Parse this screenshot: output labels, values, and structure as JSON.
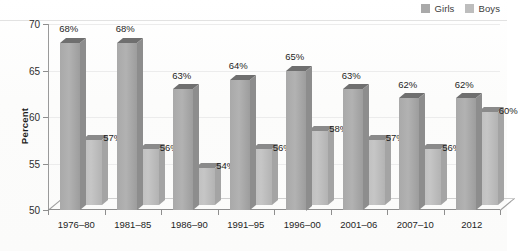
{
  "chart_data": {
    "type": "bar",
    "title": "",
    "subtitle": "",
    "xlabel": "",
    "ylabel": "Percent",
    "ylim": [
      50,
      70
    ],
    "yticks": [
      50,
      55,
      60,
      65,
      70
    ],
    "ytick_labels": [
      "50",
      "55",
      "60",
      "65",
      "70"
    ],
    "grid": true,
    "legend_position": "top-right",
    "style": "3d-grouped-bar-grayscale",
    "categories": [
      "1976–80",
      "1981–85",
      "1986–90",
      "1991–95",
      "1996–00",
      "2001–06",
      "2007–10",
      "2012"
    ],
    "series": [
      {
        "name": "Girls",
        "color": "#a9a9a9",
        "values": [
          68,
          68,
          63,
          64,
          65,
          63,
          62,
          62
        ],
        "labels": [
          "68%",
          "68%",
          "63%",
          "64%",
          "65%",
          "63%",
          "62%",
          "62%"
        ]
      },
      {
        "name": "Boys",
        "color": "#bdbdbd",
        "values": [
          57,
          56,
          54,
          56,
          58,
          57,
          56,
          60
        ],
        "labels": [
          "57%",
          "56%",
          "54%",
          "56%",
          "58%",
          "57%",
          "56%",
          "60%"
        ]
      }
    ]
  },
  "legend": {
    "items": [
      {
        "label": "Girls",
        "color": "#a9a9a9"
      },
      {
        "label": "Boys",
        "color": "#bdbdbd"
      }
    ]
  },
  "axes": {
    "y_title": "Percent"
  }
}
